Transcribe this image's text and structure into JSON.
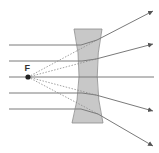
{
  "diagram": {
    "type": "concave-lens-ray-diagram",
    "focal_point_label": "F",
    "colors": {
      "lens_fill": "#c8c8c8",
      "lens_stroke": "#8c8c8c",
      "ray": "#7a7a7a",
      "focal_point": "#222222",
      "background": "#ffffff"
    },
    "incident_ray_count": 5,
    "refracted_ray_count": 5
  }
}
